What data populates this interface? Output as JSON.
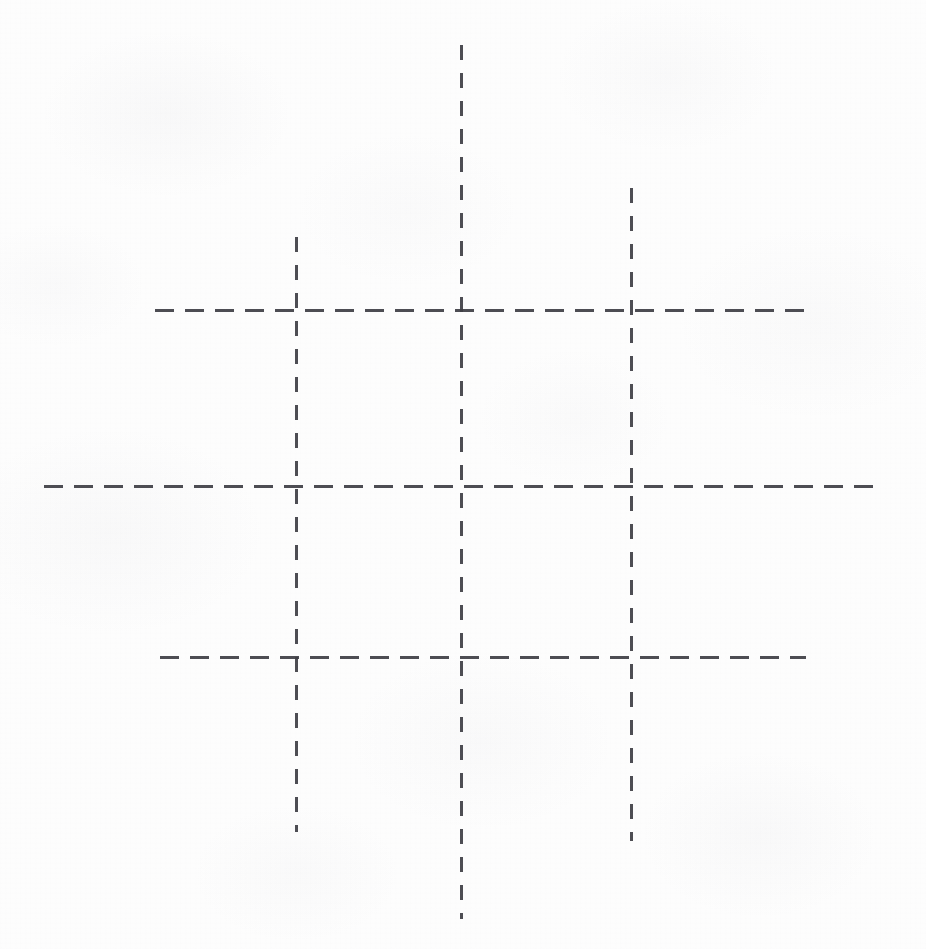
{
  "document": {
    "title": "Dashed grid",
    "description": "Scanned page showing a hand-ruled grid of three vertical and three horizontal dashed lines forming a nine-cell lattice",
    "width": 926,
    "height": 949,
    "background_color": "#fdfdfd",
    "ink_color": "#3e3e44"
  },
  "chart_data": {
    "type": "diagram",
    "xlabel": "",
    "ylabel": "",
    "grid": true,
    "legend": "none",
    "xlim": [
      0,
      926
    ],
    "ylim": [
      0,
      949
    ],
    "stroke_style": "dashed",
    "stroke_color": "#3e3e44",
    "stroke_width": 3,
    "dash_pattern_horizontal": {
      "dash": 19,
      "gap": 11
    },
    "dash_pattern_vertical": {
      "dash": 15,
      "gap": 13
    },
    "vertical_lines": [
      {
        "name": "vertical-left",
        "x": 296,
        "y_start": 237,
        "y_end": 832
      },
      {
        "name": "vertical-center",
        "x": 461,
        "y_start": 45,
        "y_end": 919
      },
      {
        "name": "vertical-right",
        "x": 631,
        "y_start": 188,
        "y_end": 841
      }
    ],
    "horizontal_lines": [
      {
        "name": "horizontal-top",
        "y": 310,
        "x_start": 155,
        "x_end": 804
      },
      {
        "name": "horizontal-middle",
        "y": 486,
        "x_start": 44,
        "x_end": 881
      },
      {
        "name": "horizontal-bottom",
        "y": 657,
        "x_start": 160,
        "x_end": 806
      }
    ],
    "intersections": [
      [
        296,
        310
      ],
      [
        461,
        310
      ],
      [
        631,
        310
      ],
      [
        296,
        486
      ],
      [
        461,
        486
      ],
      [
        631,
        486
      ],
      [
        296,
        657
      ],
      [
        461,
        657
      ],
      [
        631,
        657
      ]
    ],
    "cells": 9
  }
}
